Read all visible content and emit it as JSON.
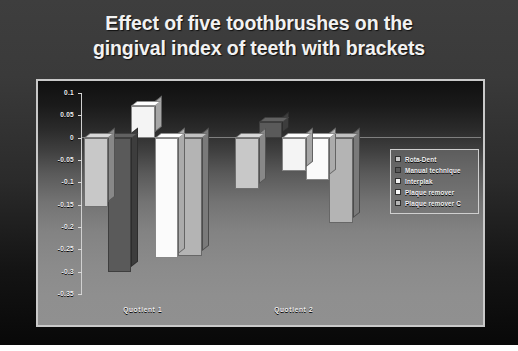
{
  "slide": {
    "title_line_1": "Effect of five toothbrushes on the",
    "title_line_2": "gingival index of teeth with brackets",
    "background_color": "#3b3b3b",
    "title_color": "#f2f2f2"
  },
  "legend": {
    "position": "right-middle",
    "entries": [
      {
        "label": "Rota-Dent",
        "color": "#c8c8c8"
      },
      {
        "label": "Manual technique",
        "color": "#5a5a5a"
      },
      {
        "label": "Interplak",
        "color": "#f4f4f4"
      },
      {
        "label": "Plaque remover",
        "color": "#fbfbfb"
      },
      {
        "label": "Plaque remover C",
        "color": "#b4b4b4"
      }
    ]
  },
  "chart_data": {
    "type": "bar",
    "title": "Effect of five toothbrushes on the gingival index of teeth with brackets",
    "xlabel": "",
    "ylabel": "",
    "categories": [
      "Quotient 1",
      "Quotient 2"
    ],
    "ylim": [
      -0.35,
      0.1
    ],
    "ytick_labels": [
      "0.1",
      "0.05",
      "0",
      "-0.05",
      "-0.1",
      "-0.15",
      "-0.2",
      "-0.25",
      "-0.3",
      "-0.35"
    ],
    "yticks": [
      0.1,
      0.05,
      0,
      -0.05,
      -0.1,
      -0.15,
      -0.2,
      -0.25,
      -0.3,
      -0.35
    ],
    "grid": false,
    "legend_position": "right",
    "series": [
      {
        "name": "Rota-Dent",
        "color": "#c8c8c8",
        "values": [
          -0.155,
          -0.115
        ]
      },
      {
        "name": "Manual technique",
        "color": "#5a5a5a",
        "values": [
          -0.3,
          0.035
        ]
      },
      {
        "name": "Interplak",
        "color": "#f4f4f4",
        "values": [
          0.07,
          -0.075
        ]
      },
      {
        "name": "Plaque remover",
        "color": "#fbfbfb",
        "values": [
          -0.27,
          -0.095
        ]
      },
      {
        "name": "Plaque remover C",
        "color": "#b4b4b4",
        "values": [
          -0.265,
          -0.19
        ]
      }
    ]
  }
}
